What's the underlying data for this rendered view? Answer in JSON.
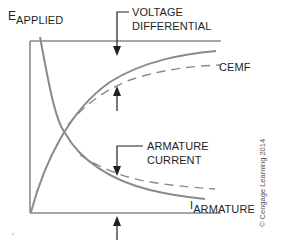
{
  "labels": {
    "e_applied": {
      "main": "E",
      "sub": "APPLIED"
    },
    "voltage_differential": [
      "VOLTAGE",
      "DIFFERENTIAL"
    ],
    "cemf": "CEMF",
    "armature_current": [
      "ARMATURE",
      "CURRENT"
    ],
    "i_armature": {
      "main": "I",
      "sub": "ARMATURE"
    }
  },
  "copyright": "© Cengage Learning 2014",
  "colors": {
    "curve": "#8a8a8a",
    "axis": "#8a8a8a",
    "arrow": "#231f20",
    "text": "#231f20"
  },
  "diagram": {
    "curves": [
      {
        "name": "E applied (top line)",
        "style": "solid"
      },
      {
        "name": "CEMF (rising solid curve)",
        "style": "solid"
      },
      {
        "name": "CEMF reference (dashed)",
        "style": "dashed"
      },
      {
        "name": "Armature current (falling solid curve)",
        "style": "solid"
      },
      {
        "name": "Armature current reference (dashed)",
        "style": "dashed"
      }
    ]
  }
}
